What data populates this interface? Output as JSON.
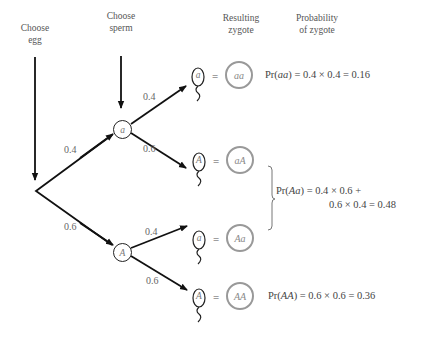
{
  "headers": {
    "egg": [
      "Choose",
      "egg"
    ],
    "sperm": [
      "Choose",
      "sperm"
    ],
    "zygote": [
      "Resulting",
      "zygote"
    ],
    "probability": [
      "Probability",
      "of zygote"
    ]
  },
  "egg_branches": [
    {
      "allele": "a",
      "probability": "0.4"
    },
    {
      "allele": "A",
      "probability": "0.6"
    }
  ],
  "sperm_branches": [
    {
      "from_egg": "a",
      "allele": "a",
      "probability": "0.4",
      "zygote": "aa"
    },
    {
      "from_egg": "a",
      "allele": "A",
      "probability": "0.6",
      "zygote": "aA"
    },
    {
      "from_egg": "A",
      "allele": "a",
      "probability": "0.4",
      "zygote": "Aa"
    },
    {
      "from_egg": "A",
      "allele": "A",
      "probability": "0.6",
      "zygote": "AA"
    }
  ],
  "equals_sign": "=",
  "probabilities": {
    "aa": {
      "prefix": "Pr(",
      "genotype": "aa",
      "expr": ") = 0.4 × 0.4 = 0.16"
    },
    "Aa": {
      "prefix": "Pr(",
      "genotype": "Aa",
      "expr_line1": ") = 0.4 × 0.6 +",
      "expr_line2": "0.6 × 0.4 = 0.48"
    },
    "AA": {
      "prefix": "Pr(",
      "genotype": "AA",
      "expr": ") = 0.6 × 0.6 = 0.36"
    }
  },
  "colors": {
    "arrow": "#111111",
    "zygote_circle": "#999999",
    "text": "#555555"
  }
}
